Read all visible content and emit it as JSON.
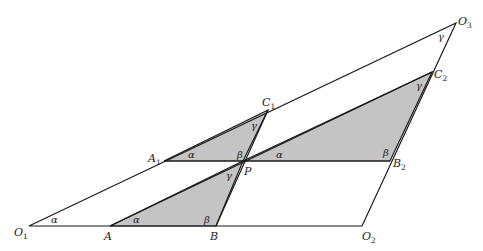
{
  "diagram": {
    "colors": {
      "line": "#1a1a1a",
      "shade": "#c4c4c4",
      "background": "#ffffff"
    },
    "points": {
      "O1": [
        29,
        226
      ],
      "A": [
        110,
        226
      ],
      "B": [
        216,
        226
      ],
      "O2": [
        362,
        226
      ],
      "A1": [
        164,
        161
      ],
      "P": [
        243,
        161
      ],
      "B2": [
        390,
        161
      ],
      "C1": [
        268,
        110
      ],
      "C2": [
        432,
        72
      ],
      "O3": [
        456,
        23
      ]
    },
    "labels": {
      "O1": {
        "main": "O",
        "sub": "1"
      },
      "A": {
        "main": "A",
        "sub": ""
      },
      "B": {
        "main": "B",
        "sub": ""
      },
      "O2": {
        "main": "O",
        "sub": "2"
      },
      "A1": {
        "main": "A",
        "sub": "1"
      },
      "P": {
        "main": "P",
        "sub": ""
      },
      "B2": {
        "main": "B",
        "sub": "2"
      },
      "C1": {
        "main": "C",
        "sub": "1"
      },
      "C2": {
        "main": "C",
        "sub": "2"
      },
      "O3": {
        "main": "O",
        "sub": "3"
      }
    },
    "angles": {
      "alpha": "α",
      "beta": "β",
      "gamma": "γ"
    },
    "shaded_triangles": [
      "A1-P-C1",
      "A-B-P",
      "P-B2-C2"
    ],
    "outer_triangle": "O1-O2-O3"
  }
}
